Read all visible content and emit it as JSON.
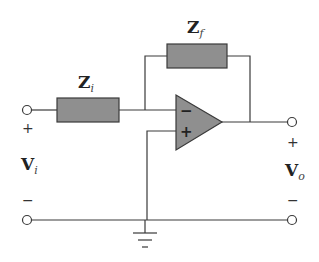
{
  "diagram": {
    "type": "inverting op-amp circuit",
    "components": {
      "input_impedance": {
        "label": "Z",
        "subscript": "i"
      },
      "feedback_impedance": {
        "label": "Z",
        "subscript": "f"
      },
      "op_amp": {
        "inverting_sign": "−",
        "noninverting_sign": "+"
      }
    },
    "input_voltage": {
      "label": "V",
      "subscript": "i",
      "plus": "+",
      "minus": "−"
    },
    "output_voltage": {
      "label": "V",
      "subscript": "o",
      "plus": "+",
      "minus": "−"
    },
    "ground": "ground-symbol"
  },
  "colors": {
    "component_fill": "#8f8f8f",
    "wire": "#3a3a3a",
    "background": "#ffffff"
  }
}
